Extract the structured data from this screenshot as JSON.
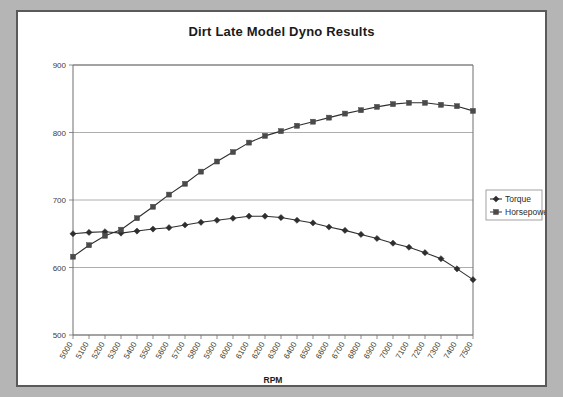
{
  "chart_data": {
    "type": "line",
    "title": "Dirt Late Model Dyno Results",
    "xlabel": "RPM",
    "ylabel": "",
    "xlim": [
      5000,
      7500
    ],
    "ylim": [
      500,
      900
    ],
    "ytick_step": 100,
    "xtick_step": 100,
    "grid": true,
    "legend_position": "right",
    "x": [
      5000,
      5100,
      5200,
      5300,
      5400,
      5500,
      5600,
      5700,
      5800,
      5900,
      6000,
      6100,
      6200,
      6300,
      6400,
      6500,
      6600,
      6700,
      6800,
      6900,
      7000,
      7100,
      7200,
      7300,
      7400,
      7500
    ],
    "categories": [
      "5000",
      "5100",
      "5200",
      "5300",
      "5400",
      "5500",
      "5600",
      "5700",
      "5800",
      "5900",
      "6000",
      "6100",
      "6200",
      "6300",
      "6400",
      "6500",
      "6600",
      "6700",
      "6800",
      "6900",
      "7000",
      "7100",
      "7200",
      "7300",
      "7400",
      "7500"
    ],
    "yticks": [
      500,
      600,
      700,
      800,
      900
    ],
    "ytick_labels": [
      "500",
      "600",
      "700",
      "800",
      "900"
    ],
    "series": [
      {
        "name": "Torque",
        "marker": "diamond",
        "color": "#2e2e2e",
        "values": [
          650,
          652,
          653,
          651,
          654,
          657,
          659,
          663,
          667,
          670,
          673,
          676,
          676,
          674,
          670,
          666,
          660,
          655,
          649,
          643,
          636,
          630,
          622,
          613,
          598,
          582
        ]
      },
      {
        "name": "Horsepower",
        "marker": "square",
        "color": "#4a4a4a",
        "values": [
          616,
          633,
          647,
          656,
          673,
          690,
          708,
          724,
          742,
          757,
          771,
          785,
          795,
          802,
          810,
          816,
          822,
          828,
          833,
          838,
          842,
          844,
          844,
          841,
          839,
          832
        ]
      }
    ]
  },
  "legend": {
    "items": [
      {
        "label": "Torque"
      },
      {
        "label": "Horsepower"
      }
    ]
  }
}
